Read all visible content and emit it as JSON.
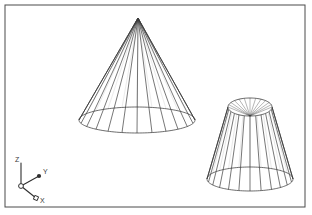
{
  "viewport": {
    "width": 312,
    "height": 215,
    "background_color": "#ffffff",
    "border_color": "#4a4a4a",
    "wireframe_color": "#3c3c3c",
    "frame": {
      "x": 5,
      "y": 5,
      "width": 300,
      "height": 202
    }
  },
  "scene": {
    "title": "3D wireframe viewport",
    "objects": [
      {
        "id": "cone",
        "name": "cone",
        "type": "cone",
        "apex": {
          "x": 138,
          "y": 18
        },
        "base_center": {
          "x": 137,
          "y": 120
        },
        "base_radius_x": 58,
        "base_radius_y": 13,
        "generator_count": 24,
        "stroke": "#3c3c3c"
      },
      {
        "id": "frustum",
        "name": "truncated-cone",
        "type": "frustum",
        "top_center": {
          "x": 250,
          "y": 107
        },
        "top_radius_x": 22,
        "top_radius_y": 9,
        "bottom_center": {
          "x": 250,
          "y": 179
        },
        "bottom_radius_x": 43,
        "bottom_radius_y": 12,
        "generator_count": 24,
        "stroke": "#3c3c3c"
      }
    ]
  },
  "axis_indicator": {
    "name": "coordinate-axis-triad",
    "origin": {
      "x": 21,
      "y": 186
    },
    "stroke": "#2e2e2e",
    "axes": [
      {
        "id": "z",
        "label": "Z",
        "tip": {
          "x": 21,
          "y": 163
        },
        "label_pos": {
          "x": 15,
          "y": 162
        },
        "marker": "none"
      },
      {
        "id": "y",
        "label": "Y",
        "tip": {
          "x": 39,
          "y": 176
        },
        "label_pos": {
          "x": 43,
          "y": 174
        },
        "marker": "filled-dot"
      },
      {
        "id": "x",
        "label": "X",
        "tip": {
          "x": 36,
          "y": 198
        },
        "label_pos": {
          "x": 40,
          "y": 203
        },
        "marker": "open-square"
      }
    ]
  }
}
